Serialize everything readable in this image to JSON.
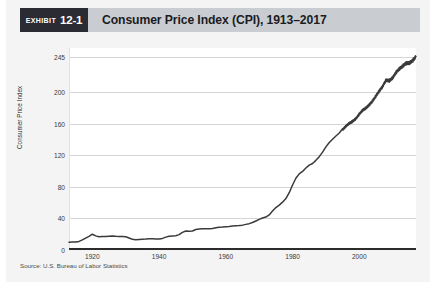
{
  "exhibit": {
    "badge_word": "Exhibit",
    "badge_number": "12-1",
    "title": "Consumer Price Index (CPI), 1913–2017",
    "source": "Source: U.S. Bureau of Labor Statistics"
  },
  "chart_data": {
    "type": "line",
    "title": "Consumer Price Index (CPI), 1913–2017",
    "xlabel": "",
    "ylabel": "Consumer Price Index",
    "xlim": [
      1913,
      2017
    ],
    "ylim": [
      0,
      256
    ],
    "grid": true,
    "legend": null,
    "line_color": "#3a3a3a",
    "xticks": [
      1920,
      1940,
      1960,
      1980,
      2000
    ],
    "xtick_labels": [
      "1920",
      "1940",
      "1960",
      "1980",
      "2000"
    ],
    "yticks": [
      0,
      40,
      80,
      120,
      160,
      200,
      245
    ],
    "ytick_labels": [
      "0",
      "40",
      "80",
      "120",
      "160",
      "200",
      "245"
    ],
    "series": [
      {
        "name": "Consumer Price Index",
        "x": [
          1913,
          1914,
          1915,
          1916,
          1917,
          1918,
          1919,
          1920,
          1921,
          1922,
          1923,
          1924,
          1925,
          1926,
          1927,
          1928,
          1929,
          1930,
          1931,
          1932,
          1933,
          1934,
          1935,
          1936,
          1937,
          1938,
          1939,
          1940,
          1941,
          1942,
          1943,
          1944,
          1945,
          1946,
          1947,
          1948,
          1949,
          1950,
          1951,
          1952,
          1953,
          1954,
          1955,
          1956,
          1957,
          1958,
          1959,
          1960,
          1961,
          1962,
          1963,
          1964,
          1965,
          1966,
          1967,
          1968,
          1969,
          1970,
          1971,
          1972,
          1973,
          1974,
          1975,
          1976,
          1977,
          1978,
          1979,
          1980,
          1981,
          1982,
          1983,
          1984,
          1985,
          1986,
          1987,
          1988,
          1989,
          1990,
          1991,
          1992,
          1993,
          1994,
          1995,
          1996,
          1997,
          1998,
          1999,
          2000,
          2001,
          2002,
          2003,
          2004,
          2005,
          2006,
          2007,
          2008,
          2009,
          2010,
          2011,
          2012,
          2013,
          2014,
          2015,
          2016,
          2017
        ],
        "values": [
          9.9,
          10.0,
          10.1,
          10.9,
          12.8,
          15.1,
          17.3,
          20.0,
          17.9,
          16.8,
          17.1,
          17.1,
          17.5,
          17.7,
          17.4,
          17.2,
          17.2,
          16.7,
          15.2,
          13.6,
          12.9,
          13.4,
          13.7,
          13.9,
          14.4,
          14.1,
          13.9,
          14.0,
          14.7,
          16.3,
          17.3,
          17.6,
          18.0,
          19.5,
          22.3,
          24.0,
          23.8,
          24.1,
          26.0,
          26.6,
          26.8,
          26.9,
          26.8,
          27.2,
          28.1,
          28.9,
          29.2,
          29.6,
          29.9,
          30.3,
          30.6,
          31.0,
          31.5,
          32.5,
          33.4,
          34.8,
          36.7,
          38.8,
          40.5,
          41.8,
          44.4,
          49.3,
          53.8,
          56.9,
          60.6,
          65.2,
          72.6,
          82.4,
          90.9,
          96.5,
          99.6,
          103.9,
          107.6,
          109.6,
          113.6,
          118.3,
          124.0,
          130.7,
          136.2,
          140.3,
          144.5,
          148.2,
          152.4,
          156.9,
          160.5,
          163.0,
          166.6,
          172.2,
          177.1,
          179.9,
          184.0,
          188.9,
          195.3,
          201.6,
          207.3,
          215.3,
          214.5,
          218.1,
          224.9,
          229.6,
          233.0,
          236.7,
          237.0,
          240.0,
          245.1
        ],
        "annotations": []
      }
    ]
  }
}
